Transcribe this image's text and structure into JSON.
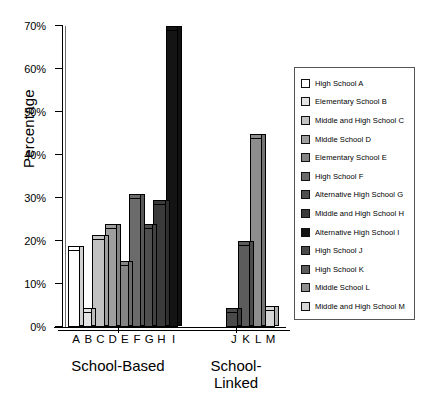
{
  "chart_data": {
    "type": "bar",
    "title": "",
    "xlabel": "",
    "ylabel": "Percentage",
    "ylim": [
      0,
      70
    ],
    "ytick_labels": [
      "0%",
      "10%",
      "20%",
      "30%",
      "40%",
      "50%",
      "60%",
      "70%"
    ],
    "ytick_values": [
      0,
      10,
      20,
      30,
      40,
      50,
      60,
      70
    ],
    "grid": false,
    "legend_position": "right",
    "categories": [
      "A",
      "B",
      "C",
      "D",
      "E",
      "F",
      "G",
      "H",
      "I",
      "J",
      "K",
      "L",
      "M"
    ],
    "values": [
      18,
      3.5,
      20.5,
      23,
      14.5,
      30,
      23,
      28.5,
      69,
      3.5,
      19,
      44,
      4
    ],
    "groups": [
      {
        "label": "School-Based",
        "categories": [
          "A",
          "B",
          "C",
          "D",
          "E",
          "F",
          "G",
          "H",
          "I"
        ]
      },
      {
        "label": "School-\nLinked",
        "label_line1": "School-",
        "label_line2": "Linked",
        "categories": [
          "J",
          "K",
          "L",
          "M"
        ]
      }
    ],
    "legend": [
      {
        "key": "A",
        "label": "High School A",
        "color": "#ffffff"
      },
      {
        "key": "B",
        "label": "Elementary School B",
        "color": "#e3e3e3"
      },
      {
        "key": "C",
        "label": "Middle and High School C",
        "color": "#c2c2c2"
      },
      {
        "key": "D",
        "label": "Middle School D",
        "color": "#9e9e9e"
      },
      {
        "key": "E",
        "label": "Elementary School E",
        "color": "#848484"
      },
      {
        "key": "F",
        "label": "High School F",
        "color": "#6b6b6b"
      },
      {
        "key": "G",
        "label": "Alternative High School G",
        "color": "#4f4f4f"
      },
      {
        "key": "H",
        "label": "Middle and High School H",
        "color": "#3a3a3a"
      },
      {
        "key": "I",
        "label": "Alternative High School I",
        "color": "#141414"
      },
      {
        "key": "J",
        "label": "High School J",
        "color": "#4a4a4a"
      },
      {
        "key": "K",
        "label": "High School K",
        "color": "#5c5c5c"
      },
      {
        "key": "L",
        "label": "Middle School L",
        "color": "#8d8d8d"
      },
      {
        "key": "M",
        "label": "Middle and High School M",
        "color": "#d6d6d6"
      }
    ]
  }
}
